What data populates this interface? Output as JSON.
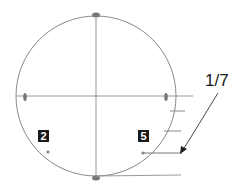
{
  "diagram": {
    "circle": {
      "cx": 96,
      "cy": 96,
      "r": 80,
      "stroke": "#888888"
    },
    "labels": [
      {
        "id": "label-2",
        "text": "2",
        "x": 38,
        "y": 130
      },
      {
        "id": "label-5",
        "text": "5",
        "x": 138,
        "y": 130
      }
    ],
    "annotation": {
      "text": "1/7",
      "x": 205,
      "y": 71
    },
    "points": [
      {
        "id": "point-2",
        "x": 48,
        "y": 152
      },
      {
        "id": "point-5",
        "x": 143,
        "y": 153
      }
    ],
    "colors": {
      "line": "#888888",
      "marker": "#777777",
      "text": "#1a1a1a"
    }
  }
}
